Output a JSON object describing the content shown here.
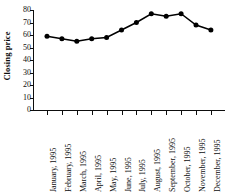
{
  "chart_data": {
    "type": "line",
    "title": "",
    "subtitle": "",
    "xlabel": "",
    "ylabel": "Closing price",
    "categories": [
      "January, 1995",
      "February, 1995",
      "March, 1995",
      "April, 1995",
      "May, 1995",
      "June, 1995",
      "July, 1995",
      "August, 1995",
      "September, 1995",
      "October, 1995",
      "November, 1995",
      "December, 1995"
    ],
    "values": [
      59,
      57,
      55,
      57,
      58,
      64,
      70,
      77,
      75,
      77,
      68,
      64
    ],
    "ylim": [
      0,
      80
    ],
    "yticks": [
      80,
      70,
      60,
      50,
      40,
      30,
      20,
      10,
      0
    ],
    "ytick_labels": [
      "80",
      "70",
      "60",
      "50",
      "40",
      "30",
      "20",
      "10",
      "0"
    ],
    "grid": false,
    "legend": false,
    "legend_position": "none",
    "marker": "filled-circle",
    "line_color": "#000000",
    "marker_color": "#000000"
  },
  "annotations": {
    "series_points": [
      {
        "category": "January, 1995",
        "value": 59
      },
      {
        "category": "February, 1995",
        "value": 57
      },
      {
        "category": "March, 1995",
        "value": 55
      },
      {
        "category": "April, 1995",
        "value": 57
      },
      {
        "category": "May, 1995",
        "value": 58
      },
      {
        "category": "June, 1995",
        "value": 64
      },
      {
        "category": "July, 1995",
        "value": 70
      },
      {
        "category": "August, 1995",
        "value": 77
      },
      {
        "category": "September, 1995",
        "value": 75
      },
      {
        "category": "October, 1995",
        "value": 77
      },
      {
        "category": "November, 1995",
        "value": 68
      },
      {
        "category": "December, 1995",
        "value": 64
      }
    ]
  }
}
